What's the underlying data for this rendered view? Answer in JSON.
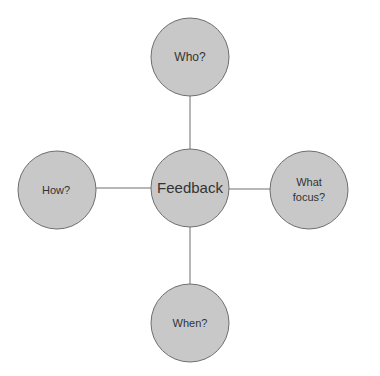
{
  "diagram": {
    "type": "hub-and-spoke",
    "colors": {
      "node_fill": "#c8c8c8",
      "node_stroke": "#6e6e6e",
      "connector": "#6e6e6e",
      "text": "#333333"
    },
    "center": {
      "label": "Feedback"
    },
    "nodes": [
      {
        "position": "top",
        "label": "Who?"
      },
      {
        "position": "right",
        "label_lines": [
          "What",
          "focus?"
        ]
      },
      {
        "position": "left",
        "label": "How?"
      },
      {
        "position": "bottom",
        "label": "When?"
      }
    ]
  }
}
